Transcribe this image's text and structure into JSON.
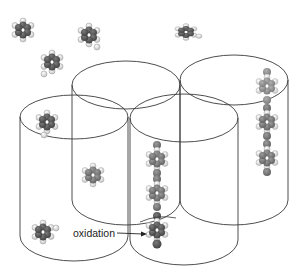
{
  "figure": {
    "annotation": {
      "label": "oxidation",
      "x": 73,
      "y": 235,
      "arrow_from": [
        118,
        232
      ],
      "arrow_to": [
        146,
        233
      ]
    },
    "colors": {
      "background": "#ffffff",
      "outline": "#3a3a3a",
      "molecule_dark": "#4a4a4a",
      "molecule_mid": "#6e6e6e",
      "molecule_light": "#8a8a8a",
      "hydrogen": "#d8d8d8",
      "oxidized": "#3c3c3c"
    },
    "cylinders": [
      {
        "name": "back-left",
        "cx": 126,
        "top": 85,
        "bottom": 200,
        "rx": 54,
        "ry": 24
      },
      {
        "name": "back-right",
        "cx": 234,
        "top": 80,
        "bottom": 200,
        "rx": 54,
        "ry": 25
      },
      {
        "name": "front-left",
        "cx": 74,
        "top": 117,
        "bottom": 236,
        "rx": 54,
        "ry": 22
      },
      {
        "name": "front-mid",
        "cx": 184,
        "top": 118,
        "bottom": 240,
        "rx": 54,
        "ry": 24
      }
    ],
    "free_molecules": [
      {
        "x": 23,
        "y": 30,
        "shade": "dark"
      },
      {
        "x": 89,
        "y": 35,
        "shade": "dark"
      },
      {
        "x": 52,
        "y": 62,
        "shade": "dark"
      },
      {
        "x": 186,
        "y": 32,
        "shade": "dark"
      },
      {
        "x": 47,
        "y": 122,
        "shade": "dark"
      },
      {
        "x": 93,
        "y": 175,
        "shade": "mid"
      },
      {
        "x": 43,
        "y": 232,
        "shade": "dark"
      }
    ],
    "stacked_columns": [
      {
        "name": "front-mid-stack",
        "x": 157,
        "ys": [
          159,
          193,
          228
        ],
        "oxidized_index": 2
      },
      {
        "name": "back-right-stack",
        "x": 267,
        "ys": [
          86,
          122,
          158
        ],
        "oxidized_index": -1
      }
    ]
  }
}
